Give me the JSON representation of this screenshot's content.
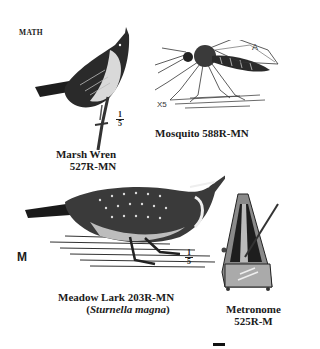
{
  "page": {
    "section_label": "MATH",
    "side_letter": "M"
  },
  "items": [
    {
      "name": "Marsh Wren",
      "code": "527R-MN",
      "scale": {
        "numerator": "1",
        "denominator": "5"
      }
    },
    {
      "name": "Mosquito",
      "code": "588R-MN",
      "annotations": {
        "magnification": "X5",
        "marker": "A"
      }
    },
    {
      "name": "Meadow Lark",
      "code": "203R-MN",
      "scientific_name": "Sturnella magna",
      "scale": {
        "numerator": "1",
        "denominator": "5"
      }
    },
    {
      "name": "Metronome",
      "code": "525R-M"
    }
  ],
  "captions": {
    "marsh_wren_line1": "Marsh Wren",
    "marsh_wren_line2": "527R-MN",
    "mosquito": "Mosquito 588R-MN",
    "meadow_lark_line1": "Meadow Lark 203R-MN",
    "meadow_lark_line2_open": "(",
    "meadow_lark_line2_italic": "Sturnella magna",
    "meadow_lark_line2_close": ")",
    "metronome_line1": "Metronome",
    "metronome_line2": "525R-M"
  }
}
